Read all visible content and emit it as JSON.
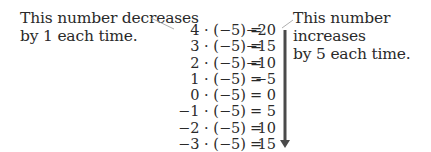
{
  "annotations": {
    "left": [
      "This number decreases",
      "by 1 each time."
    ],
    "right": [
      "This number increases",
      "by 5 each time."
    ]
  },
  "equations": [
    {
      "lhs": "4 · (−5)",
      "eq": "=",
      "rhs": "−20"
    },
    {
      "lhs": "3 · (−5)",
      "eq": "=",
      "rhs": "−15"
    },
    {
      "lhs": "2 · (−5)",
      "eq": "=",
      "rhs": "−10"
    },
    {
      "lhs": "1 · (−5)",
      "eq": "=",
      "rhs": "−5"
    },
    {
      "lhs": "0 · (−5)",
      "eq": "=",
      "rhs": "0"
    },
    {
      "lhs": "−1 · (−5)",
      "eq": "=",
      "rhs": "5"
    },
    {
      "lhs": "−2 · (−5)",
      "eq": "=",
      "rhs": "10"
    },
    {
      "lhs": "−3 · (−5)",
      "eq": "=",
      "rhs": "15"
    }
  ],
  "colors": {
    "text": "#2a2a2a",
    "leader_line": "#9a9a9a",
    "arrow": "#4a4a4a"
  }
}
